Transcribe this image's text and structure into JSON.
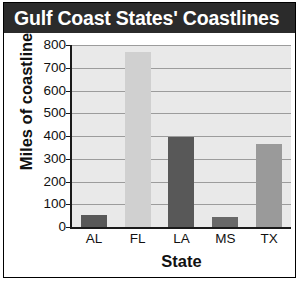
{
  "header": {
    "title": "Gulf Coast States' Coastlines"
  },
  "colors": {
    "header_background": "#2b2b2b",
    "header_text": "#ffffff",
    "plot_background": "#e9e9e9",
    "gridline": "#9c9c9c",
    "axis": "#1a1a1a",
    "bar_dark": "#585858",
    "bar_light": "#d0d0d0",
    "bar_medium": "#9a9a9a"
  },
  "chart_data": {
    "type": "bar",
    "title": "Gulf Coast States' Coastlines",
    "xlabel": "State",
    "ylabel": "Miles of coastline",
    "categories": [
      "AL",
      "FL",
      "LA",
      "MS",
      "TX"
    ],
    "values": [
      53,
      770,
      397,
      44,
      367
    ],
    "bar_colors": [
      "#585858",
      "#d0d0d0",
      "#585858",
      "#686868",
      "#9a9a9a"
    ],
    "ylim": [
      0,
      800
    ],
    "yticks": [
      800,
      700,
      600,
      500,
      400,
      300,
      200,
      100,
      0
    ],
    "ytick_labels": [
      "800",
      "700",
      "600",
      "500",
      "400",
      "300",
      "200",
      "100",
      "0"
    ],
    "grid": true,
    "grid_axis": "y",
    "legend": null,
    "legend_position": "none"
  }
}
